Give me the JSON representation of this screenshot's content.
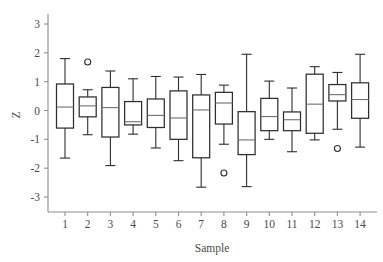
{
  "chart_data": {
    "type": "box",
    "title": "",
    "xlabel": "Sample",
    "ylabel": "Z",
    "categories": [
      "1",
      "2",
      "3",
      "4",
      "5",
      "6",
      "7",
      "8",
      "9",
      "10",
      "11",
      "12",
      "13",
      "14"
    ],
    "ylim": [
      -3.6,
      3.5
    ],
    "yticks": [
      -3,
      -2,
      -1,
      0,
      1,
      2,
      3
    ],
    "ytick_labels": [
      "-3",
      "-2",
      "-1",
      "0",
      "1",
      "2",
      "3"
    ],
    "xticks": [
      1,
      2,
      3,
      4,
      5,
      6,
      7,
      8,
      9,
      10,
      11,
      12,
      13,
      14
    ],
    "xtick_labels": [
      "1",
      "2",
      "3",
      "4",
      "5",
      "6",
      "7",
      "8",
      "9",
      "10",
      "11",
      "12",
      "13",
      "14"
    ],
    "grid": false,
    "legend": null,
    "boxes": [
      {
        "category": "1",
        "whisker_low": -1.65,
        "q1": -0.61,
        "median": 0.12,
        "q3": 0.92,
        "whisker_high": 1.8,
        "outliers": []
      },
      {
        "category": "2",
        "whisker_low": -0.84,
        "q1": -0.22,
        "median": 0.16,
        "q3": 0.47,
        "whisker_high": 0.72,
        "outliers": [
          1.68
        ]
      },
      {
        "category": "3",
        "whisker_low": -1.91,
        "q1": -0.92,
        "median": 0.1,
        "q3": 0.8,
        "whisker_high": 1.37,
        "outliers": []
      },
      {
        "category": "4",
        "whisker_low": -0.82,
        "q1": -0.5,
        "median": -0.39,
        "q3": 0.31,
        "whisker_high": 1.1,
        "outliers": []
      },
      {
        "category": "5",
        "whisker_low": -1.3,
        "q1": -0.59,
        "median": -0.17,
        "q3": 0.4,
        "whisker_high": 1.18,
        "outliers": []
      },
      {
        "category": "6",
        "whisker_low": -1.74,
        "q1": -1.0,
        "median": -0.26,
        "q3": 0.68,
        "whisker_high": 1.16,
        "outliers": []
      },
      {
        "category": "7",
        "whisker_low": -2.66,
        "q1": -1.64,
        "median": 0.02,
        "q3": 0.54,
        "whisker_high": 1.25,
        "outliers": []
      },
      {
        "category": "8",
        "whisker_low": -1.17,
        "q1": -0.47,
        "median": 0.26,
        "q3": 0.63,
        "whisker_high": 0.88,
        "outliers": [
          -2.17
        ]
      },
      {
        "category": "9",
        "whisker_low": -2.64,
        "q1": -1.53,
        "median": -1.02,
        "q3": -0.04,
        "whisker_high": 1.95,
        "outliers": []
      },
      {
        "category": "10",
        "whisker_low": -1.0,
        "q1": -0.7,
        "median": -0.21,
        "q3": 0.42,
        "whisker_high": 1.02,
        "outliers": []
      },
      {
        "category": "11",
        "whisker_low": -1.43,
        "q1": -0.7,
        "median": -0.32,
        "q3": -0.05,
        "whisker_high": 0.78,
        "outliers": []
      },
      {
        "category": "12",
        "whisker_low": -1.02,
        "q1": -0.79,
        "median": 0.22,
        "q3": 1.26,
        "whisker_high": 1.52,
        "outliers": []
      },
      {
        "category": "13",
        "whisker_low": -0.65,
        "q1": 0.33,
        "median": 0.55,
        "q3": 0.9,
        "whisker_high": 1.32,
        "outliers": [
          -1.32
        ]
      },
      {
        "category": "14",
        "whisker_low": -1.27,
        "q1": -0.27,
        "median": 0.38,
        "q3": 0.96,
        "whisker_high": 1.95,
        "outliers": []
      }
    ]
  },
  "axes": {
    "y_axis_label": "Z",
    "x_axis_label": "Sample"
  },
  "colors": {
    "box_stroke": "#2e2e2e",
    "median_stroke": "#6f6f6f",
    "axis": "#8e8e8e",
    "text": "#4a4a4a",
    "background": "#ffffff"
  }
}
